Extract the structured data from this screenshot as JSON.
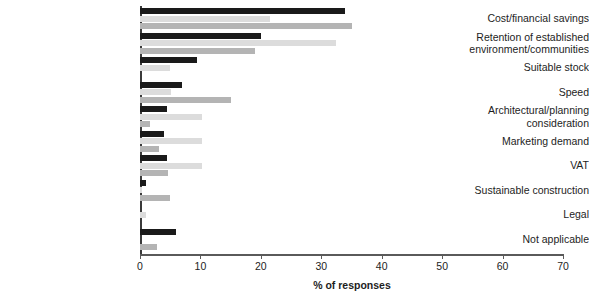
{
  "chart_data": {
    "type": "bar",
    "orientation": "horizontal",
    "title": "",
    "xlabel": "% of responses",
    "ylabel": "",
    "xlim": [
      0,
      70
    ],
    "xticks": [
      0,
      10,
      20,
      30,
      40,
      50,
      60,
      70
    ],
    "grid": false,
    "legend": "none",
    "categories": [
      "Cost/financial savings",
      "Retention of established environment/communities",
      "Suitable stock",
      "Speed",
      "Architectural/planning consideration",
      "Marketing demand",
      "VAT",
      "Sustainable construction",
      "Legal",
      "Not applicable"
    ],
    "series": [
      {
        "name": "Series 1",
        "color": "#1a1a1a",
        "values": [
          34,
          20,
          9.5,
          7,
          4.5,
          4,
          4.5,
          1,
          0,
          6
        ]
      },
      {
        "name": "Series 2",
        "color": "#dcdcdc",
        "values": [
          21.5,
          32.5,
          5,
          5.2,
          10.3,
          10.3,
          10.3,
          0.4,
          1,
          0
        ]
      },
      {
        "name": "Series 3",
        "color": "#b4b4b4",
        "values": [
          35,
          19,
          0,
          15,
          1.6,
          3.2,
          4.7,
          5,
          0,
          2.8
        ]
      }
    ]
  },
  "axis": {
    "tick_labels": [
      "0",
      "10",
      "20",
      "30",
      "40",
      "50",
      "60",
      "70"
    ],
    "x_axis_title": "% of responses"
  },
  "category_labels": [
    {
      "lines": [
        "Cost/financial savings"
      ]
    },
    {
      "lines": [
        "Retention of established",
        "environment/communities"
      ]
    },
    {
      "lines": [
        "Suitable stock"
      ]
    },
    {
      "lines": [
        "Speed"
      ]
    },
    {
      "lines": [
        "Architectural/planning",
        "consideration"
      ]
    },
    {
      "lines": [
        "Marketing demand"
      ]
    },
    {
      "lines": [
        "VAT"
      ]
    },
    {
      "lines": [
        "Sustainable construction"
      ]
    },
    {
      "lines": [
        "Legal"
      ]
    },
    {
      "lines": [
        "Not applicable"
      ]
    }
  ]
}
